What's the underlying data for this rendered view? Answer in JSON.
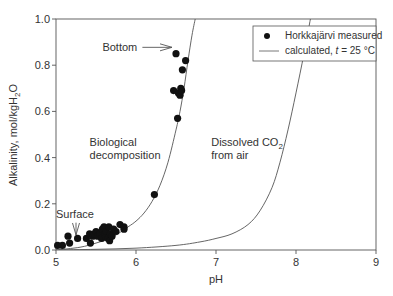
{
  "chart_data": {
    "type": "scatter",
    "title": "",
    "xlabel": "pH",
    "ylabel": "Alkalinity, mol/kgH2O",
    "ylabel_parts": {
      "main": "Alkalinity, mol/kgH",
      "sub": "2",
      "tail": "O"
    },
    "xlim": [
      5,
      9
    ],
    "ylim": [
      0,
      1.0
    ],
    "xticks": [
      5,
      6,
      7,
      8,
      9
    ],
    "yticks": [
      0.0,
      0.2,
      0.4,
      0.6,
      0.8,
      1.0
    ],
    "ytick_labels": [
      "0.0",
      "0.2",
      "0.4",
      "0.6",
      "0.8",
      "1.0"
    ],
    "grid": false,
    "legend": {
      "position": "upper right",
      "entries": [
        {
          "marker": "circle",
          "label": "Horkkajärvi measured"
        },
        {
          "marker": "line",
          "label_pre": "calculated, ",
          "label_italic": "t",
          "label_post": " = 25 °C"
        }
      ]
    },
    "series": [
      {
        "name": "Horkkajärvi measured",
        "kind": "scatter",
        "points": [
          [
            5.02,
            0.02
          ],
          [
            5.08,
            0.02
          ],
          [
            5.15,
            0.06
          ],
          [
            5.17,
            0.03
          ],
          [
            5.27,
            0.05
          ],
          [
            5.38,
            0.05
          ],
          [
            5.42,
            0.07
          ],
          [
            5.43,
            0.03
          ],
          [
            5.46,
            0.06
          ],
          [
            5.48,
            0.07
          ],
          [
            5.5,
            0.08
          ],
          [
            5.52,
            0.06
          ],
          [
            5.55,
            0.07
          ],
          [
            5.57,
            0.05
          ],
          [
            5.58,
            0.09
          ],
          [
            5.6,
            0.1
          ],
          [
            5.61,
            0.07
          ],
          [
            5.62,
            0.06
          ],
          [
            5.63,
            0.08
          ],
          [
            5.65,
            0.05
          ],
          [
            5.66,
            0.1
          ],
          [
            5.67,
            0.04
          ],
          [
            5.68,
            0.07
          ],
          [
            5.7,
            0.06
          ],
          [
            5.72,
            0.09
          ],
          [
            5.75,
            0.08
          ],
          [
            5.8,
            0.11
          ],
          [
            5.85,
            0.1
          ],
          [
            5.85,
            0.09
          ],
          [
            6.23,
            0.24
          ],
          [
            6.47,
            0.69
          ],
          [
            6.5,
            0.85
          ],
          [
            6.52,
            0.57
          ],
          [
            6.53,
            0.68
          ],
          [
            6.55,
            0.67
          ],
          [
            6.56,
            0.7
          ],
          [
            6.57,
            0.69
          ],
          [
            6.58,
            0.78
          ],
          [
            6.62,
            0.82
          ]
        ]
      },
      {
        "name": "calculated, t = 25 °C (biological decomposition)",
        "kind": "line",
        "points": [
          [
            5.0,
            0.0
          ],
          [
            5.3,
            0.012
          ],
          [
            5.5,
            0.03
          ],
          [
            5.7,
            0.055
          ],
          [
            5.9,
            0.1
          ],
          [
            6.0,
            0.125
          ],
          [
            6.1,
            0.16
          ],
          [
            6.2,
            0.21
          ],
          [
            6.3,
            0.28
          ],
          [
            6.4,
            0.38
          ],
          [
            6.5,
            0.52
          ],
          [
            6.55,
            0.6
          ],
          [
            6.6,
            0.7
          ],
          [
            6.65,
            0.82
          ],
          [
            6.7,
            0.93
          ],
          [
            6.74,
            1.0
          ]
        ]
      },
      {
        "name": "calculated, t = 25 °C (dissolved CO2 from air)",
        "kind": "line",
        "points": [
          [
            5.0,
            0.0
          ],
          [
            5.5,
            0.003
          ],
          [
            6.0,
            0.008
          ],
          [
            6.5,
            0.02
          ],
          [
            6.8,
            0.035
          ],
          [
            7.0,
            0.05
          ],
          [
            7.2,
            0.07
          ],
          [
            7.4,
            0.11
          ],
          [
            7.55,
            0.17
          ],
          [
            7.7,
            0.27
          ],
          [
            7.8,
            0.38
          ],
          [
            7.9,
            0.52
          ],
          [
            8.0,
            0.68
          ],
          [
            8.1,
            0.85
          ],
          [
            8.18,
            1.0
          ]
        ]
      }
    ],
    "annotations": [
      {
        "id": "bottom",
        "text": "Bottom",
        "x": 5.58,
        "y": 0.86,
        "arrow_to": [
          6.45,
          0.855
        ]
      },
      {
        "id": "surface",
        "text": "Surface",
        "x": 5.0,
        "y": 0.14,
        "arrow_to": [
          5.25,
          0.065
        ]
      },
      {
        "id": "bio1",
        "text": "Biological",
        "x": 5.42,
        "y": 0.45
      },
      {
        "id": "bio2",
        "text": "decomposition",
        "x": 5.42,
        "y": 0.395
      },
      {
        "id": "co2a",
        "text": "Dissolved  CO",
        "sub": "2",
        "x": 6.94,
        "y": 0.45
      },
      {
        "id": "co2b",
        "text": "from air",
        "x": 6.94,
        "y": 0.395
      }
    ]
  },
  "plot_area": {
    "left": 56,
    "right": 376,
    "top": 19,
    "bottom": 250
  }
}
